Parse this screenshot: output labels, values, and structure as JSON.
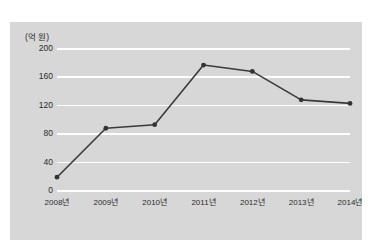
{
  "page": {
    "clipped_header_text": "ᄀ ᄂ ᄃ ᄅ ᄆ ᄇ ᄉ ᄋ ᄌ ᄎ"
  },
  "chart_data": {
    "type": "line",
    "title": "",
    "subtitle": "",
    "unit_label": "(억 원)",
    "xlabel": "",
    "ylabel": "",
    "categories": [
      "2008년",
      "2009년",
      "2010년",
      "2011년",
      "2012년",
      "2013년",
      "2014년"
    ],
    "values": [
      18,
      87,
      92,
      176,
      167,
      127,
      122
    ],
    "series": [
      {
        "name": "",
        "values": [
          18,
          87,
          92,
          176,
          167,
          127,
          122
        ]
      }
    ],
    "yticks": [
      0,
      40,
      80,
      120,
      160,
      200
    ],
    "ytick_labels": [
      "0",
      "40",
      "80",
      "120",
      "160",
      "200"
    ],
    "ylim": [
      0,
      200
    ],
    "grid": "horizontal",
    "legend": "none",
    "colors": {
      "panel_background": "#d7d7d7",
      "gridline": "#ffffff",
      "line": "#3a3a3a",
      "marker": "#333333",
      "text": "#2b2b2b",
      "page_background": "#ffffff"
    }
  }
}
